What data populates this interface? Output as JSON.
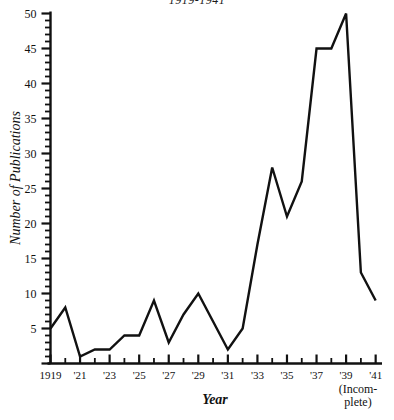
{
  "chart_data": {
    "type": "line",
    "title": "1919-1941",
    "xlabel": "Year",
    "ylabel": "Number of Publications",
    "x": [
      1919,
      1920,
      1921,
      1922,
      1923,
      1924,
      1925,
      1926,
      1927,
      1928,
      1929,
      1930,
      1931,
      1932,
      1933,
      1934,
      1935,
      1936,
      1937,
      1938,
      1939,
      1940,
      1941
    ],
    "values": [
      5,
      8,
      1,
      2,
      2,
      4,
      4,
      9,
      3,
      7,
      10,
      6,
      2,
      5,
      17,
      28,
      21,
      26,
      45,
      45,
      50,
      13,
      9
    ],
    "categories": [
      "1919",
      "'20",
      "'21",
      "'22",
      "'23",
      "'24",
      "'25",
      "'26",
      "'27",
      "'28",
      "'29",
      "'30",
      "'31",
      "'32",
      "'33",
      "'34",
      "'35",
      "'36",
      "'37",
      "'38",
      "'39",
      "'40",
      "'41"
    ],
    "xlim": [
      1919,
      1941
    ],
    "ylim": [
      0,
      50
    ],
    "grid": false,
    "legend": false,
    "line_color": "#111111",
    "annotations": [
      "(Incomplete)"
    ]
  },
  "axes": {
    "y": {
      "label": "Number of Publications",
      "ticks": [
        {
          "value": 50,
          "label": "50"
        },
        {
          "value": 45,
          "label": "45"
        },
        {
          "value": 40,
          "label": "40"
        },
        {
          "value": 35,
          "label": "35"
        },
        {
          "value": 30,
          "label": "30"
        },
        {
          "value": 25,
          "label": "25"
        },
        {
          "value": 20,
          "label": "20"
        },
        {
          "value": 15,
          "label": "15"
        },
        {
          "value": 10,
          "label": "10"
        },
        {
          "value": 5,
          "label": "5"
        }
      ],
      "minor_tick_step": 1
    },
    "x": {
      "label": "Year",
      "ticks": [
        {
          "value": 1919,
          "label": "1919"
        },
        {
          "value": 1921,
          "label": "'21"
        },
        {
          "value": 1923,
          "label": "'23"
        },
        {
          "value": 1925,
          "label": "'25"
        },
        {
          "value": 1927,
          "label": "'27"
        },
        {
          "value": 1929,
          "label": "'29"
        },
        {
          "value": 1931,
          "label": "'31"
        },
        {
          "value": 1933,
          "label": "'33"
        },
        {
          "value": 1935,
          "label": "'35"
        },
        {
          "value": 1937,
          "label": "'37"
        },
        {
          "value": 1939,
          "label": "'39"
        },
        {
          "value": 1941,
          "label": "'41"
        }
      ],
      "minor_tick_step": 1
    }
  },
  "notes": {
    "incomplete_line1": "(Incom-",
    "incomplete_line2": "plete)"
  }
}
